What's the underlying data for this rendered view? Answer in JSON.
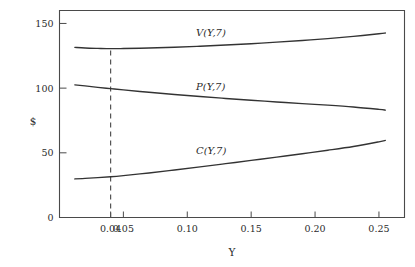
{
  "chart_data": {
    "type": "line",
    "title": "",
    "xlabel": "Y",
    "ylabel": "$",
    "xlim": [
      0.0,
      0.27
    ],
    "ylim": [
      0,
      160
    ],
    "grid": false,
    "legend_position": "inline-annotations",
    "x_ticks": [
      "0.04",
      "0.05",
      "0.10",
      "0.15",
      "0.20",
      "0.25"
    ],
    "x_tick_values": [
      0.04,
      0.05,
      0.1,
      0.15,
      0.2,
      0.25
    ],
    "y_ticks": [
      "0",
      "50",
      "100",
      "150"
    ],
    "y_tick_values": [
      0,
      50,
      100,
      150
    ],
    "x": [
      0.012,
      0.02,
      0.03,
      0.04,
      0.05,
      0.07,
      0.09,
      0.11,
      0.13,
      0.15,
      0.17,
      0.19,
      0.21,
      0.23,
      0.25,
      0.255
    ],
    "series": [
      {
        "name": "V(Y,7)",
        "label": "V(Y,7)",
        "color": "#333333",
        "values": [
          131.5,
          131.0,
          130.7,
          130.5,
          130.6,
          131.0,
          131.6,
          132.4,
          133.3,
          134.3,
          135.5,
          136.8,
          138.3,
          140.0,
          142.0,
          142.6
        ]
      },
      {
        "name": "P(Y,7)",
        "label": "P(Y,7)",
        "color": "#333333",
        "values": [
          102.5,
          101.7,
          100.6,
          99.6,
          98.6,
          96.8,
          95.1,
          93.5,
          92.0,
          90.6,
          89.3,
          88.0,
          86.8,
          85.4,
          83.6,
          83.0
        ]
      },
      {
        "name": "C(Y,7)",
        "label": "C(Y,7)",
        "color": "#333333",
        "values": [
          29.8,
          30.2,
          30.8,
          31.5,
          32.4,
          34.4,
          36.7,
          39.1,
          41.6,
          44.1,
          46.7,
          49.3,
          52.0,
          54.9,
          58.5,
          59.6
        ]
      }
    ],
    "annotations": [
      {
        "name": "marker-line",
        "type": "vertical-dashed",
        "x": 0.04,
        "y_from": 0,
        "y_to": 130.5
      }
    ],
    "curve_labels": [
      {
        "text": "V(Y,7)",
        "x_px": 196,
        "y_px": 36
      },
      {
        "text": "P(Y,7)",
        "x_px": 196,
        "y_px": 90
      },
      {
        "text": "C(Y,7)",
        "x_px": 196,
        "y_px": 154
      }
    ]
  }
}
